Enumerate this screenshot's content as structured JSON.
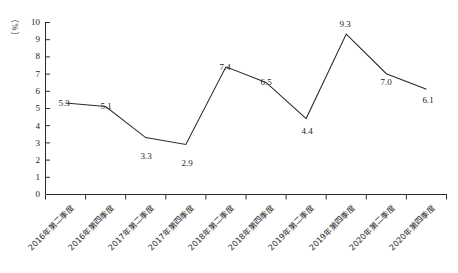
{
  "chart_data": {
    "type": "line",
    "title": "",
    "xlabel": "",
    "ylabel": "（%）",
    "ylim": [
      0,
      10
    ],
    "ytick_step": 1,
    "yticks": [
      "10",
      "9",
      "8",
      "7",
      "6",
      "5",
      "4",
      "3",
      "2",
      "1",
      "0"
    ],
    "grid": false,
    "legend": null,
    "line_color": "#2b2b2b",
    "categories": [
      "2016年第二季度",
      "2016年第四季度",
      "2017年第二季度",
      "2017年第四季度",
      "2018年第二季度",
      "2018年第四季度",
      "2019年第二季度",
      "2019年第四季度",
      "2020年第二季度",
      "2020年第四季度"
    ],
    "values": [
      5.3,
      5.1,
      3.3,
      2.9,
      7.4,
      6.5,
      4.4,
      9.3,
      7.0,
      6.1
    ],
    "data_labels": [
      "5.3",
      "5.1",
      "3.3",
      "2.9",
      "7.4",
      "6.5",
      "4.4",
      "9.3",
      "7.0",
      "6.1"
    ]
  }
}
